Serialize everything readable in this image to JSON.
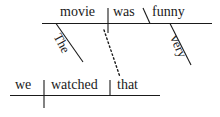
{
  "diagram": {
    "type": "reed-kellogg-sentence-diagram",
    "sentence": "We watched that movie that was very funny",
    "ink_color": "#1a1a1a",
    "background_color": "#ffffff",
    "clauses": {
      "main": {
        "name": "main-clause",
        "subject": "we",
        "verb": "watched",
        "direct_object": "that"
      },
      "relative": {
        "name": "relative-clause",
        "subject": "movie",
        "verb": "was",
        "predicate_adjective": "funny",
        "article_modifier": "The",
        "adverb_modifier": "very"
      }
    },
    "words": {
      "movie": "movie",
      "was": "was",
      "funny": "funny",
      "the": "The",
      "very": "very",
      "we": "we",
      "watched": "watched",
      "that": "that"
    },
    "connector": {
      "style": "dotted",
      "label": "relative-pronoun-link"
    }
  }
}
